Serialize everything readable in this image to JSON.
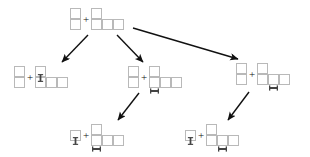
{
  "diagram": {
    "title": "",
    "type": "tree",
    "cell_size": 11,
    "colors": {
      "cell_stroke": "#b9b9b9",
      "cell_fill": "#ffffff",
      "bone": "#444444",
      "arrow": "#111111",
      "background": "#ffffff"
    },
    "operator_label": "+",
    "nodes": [
      {
        "id": "root",
        "name": "root-state",
        "x": 70,
        "y": 8,
        "left_piece": {
          "name": "vertical-domino",
          "cells": [
            [
              0,
              0
            ],
            [
              0,
              1
            ]
          ],
          "marks": []
        },
        "right_piece": {
          "name": "l-shape-piece",
          "cells": [
            [
              0,
              0
            ],
            [
              0,
              1
            ],
            [
              1,
              1
            ],
            [
              2,
              1
            ]
          ],
          "marks": []
        }
      },
      {
        "id": "child-left",
        "name": "left-branch-state",
        "x": 14,
        "y": 66,
        "left_piece": {
          "name": "vertical-domino",
          "cells": [
            [
              0,
              0
            ],
            [
              0,
              1
            ]
          ],
          "marks": []
        },
        "right_piece": {
          "name": "l-shape-piece",
          "cells": [
            [
              0,
              0
            ],
            [
              0,
              1
            ],
            [
              1,
              1
            ],
            [
              2,
              1
            ]
          ],
          "marks": [
            {
              "type": "bone-vertical",
              "cell": [
                0,
                0
              ]
            }
          ]
        }
      },
      {
        "id": "child-center",
        "name": "center-branch-state",
        "x": 128,
        "y": 66,
        "left_piece": {
          "name": "vertical-domino",
          "cells": [
            [
              0,
              0
            ],
            [
              0,
              1
            ]
          ],
          "marks": []
        },
        "right_piece": {
          "name": "l-shape-piece",
          "cells": [
            [
              0,
              0
            ],
            [
              0,
              1
            ],
            [
              1,
              1
            ],
            [
              2,
              1
            ]
          ],
          "marks": [
            {
              "type": "bone-horizontal",
              "cell": [
                0,
                1
              ]
            }
          ]
        }
      },
      {
        "id": "child-right",
        "name": "right-branch-state",
        "x": 236,
        "y": 63,
        "left_piece": {
          "name": "vertical-domino",
          "cells": [
            [
              0,
              0
            ],
            [
              0,
              1
            ]
          ],
          "marks": []
        },
        "right_piece": {
          "name": "l-shape-piece",
          "cells": [
            [
              0,
              0
            ],
            [
              0,
              1
            ],
            [
              1,
              1
            ],
            [
              2,
              1
            ]
          ],
          "marks": [
            {
              "type": "bone-horizontal",
              "cell": [
                1,
                1
              ]
            }
          ]
        }
      },
      {
        "id": "leaf-left",
        "name": "left-leaf-state",
        "x": 70,
        "y": 124,
        "left_piece": {
          "name": "single-cell",
          "cells": [
            [
              0,
              0
            ]
          ],
          "marks": [
            {
              "type": "bone-vertical",
              "cell": [
                0,
                0
              ]
            }
          ]
        },
        "right_piece": {
          "name": "l-shape-piece",
          "cells": [
            [
              0,
              0
            ],
            [
              0,
              1
            ],
            [
              1,
              1
            ],
            [
              2,
              1
            ]
          ],
          "marks": [
            {
              "type": "bone-horizontal",
              "cell": [
                0,
                1
              ]
            }
          ]
        }
      },
      {
        "id": "leaf-right",
        "name": "right-leaf-state",
        "x": 185,
        "y": 124,
        "left_piece": {
          "name": "single-cell",
          "cells": [
            [
              0,
              0
            ]
          ],
          "marks": [
            {
              "type": "bone-vertical",
              "cell": [
                0,
                0
              ]
            }
          ]
        },
        "right_piece": {
          "name": "l-shape-piece",
          "cells": [
            [
              0,
              0
            ],
            [
              0,
              1
            ],
            [
              1,
              1
            ],
            [
              2,
              1
            ]
          ],
          "marks": [
            {
              "type": "bone-horizontal",
              "cell": [
                1,
                1
              ]
            }
          ]
        }
      }
    ],
    "edges": [
      {
        "name": "edge-root-to-left",
        "from": "root",
        "to": "child-left",
        "x1": 88,
        "y1": 35,
        "x2": 62,
        "y2": 62
      },
      {
        "name": "edge-root-to-center",
        "from": "root",
        "to": "child-center",
        "x1": 117,
        "y1": 35,
        "x2": 143,
        "y2": 62
      },
      {
        "name": "edge-root-to-right",
        "from": "root",
        "to": "child-right",
        "x1": 133,
        "y1": 28,
        "x2": 238,
        "y2": 59
      },
      {
        "name": "edge-center-to-leaf-left",
        "from": "child-center",
        "to": "leaf-left",
        "x1": 139,
        "y1": 93,
        "x2": 118,
        "y2": 120
      },
      {
        "name": "edge-right-to-leaf-right",
        "from": "child-right",
        "to": "leaf-right",
        "x1": 249,
        "y1": 92,
        "x2": 228,
        "y2": 120
      }
    ]
  }
}
